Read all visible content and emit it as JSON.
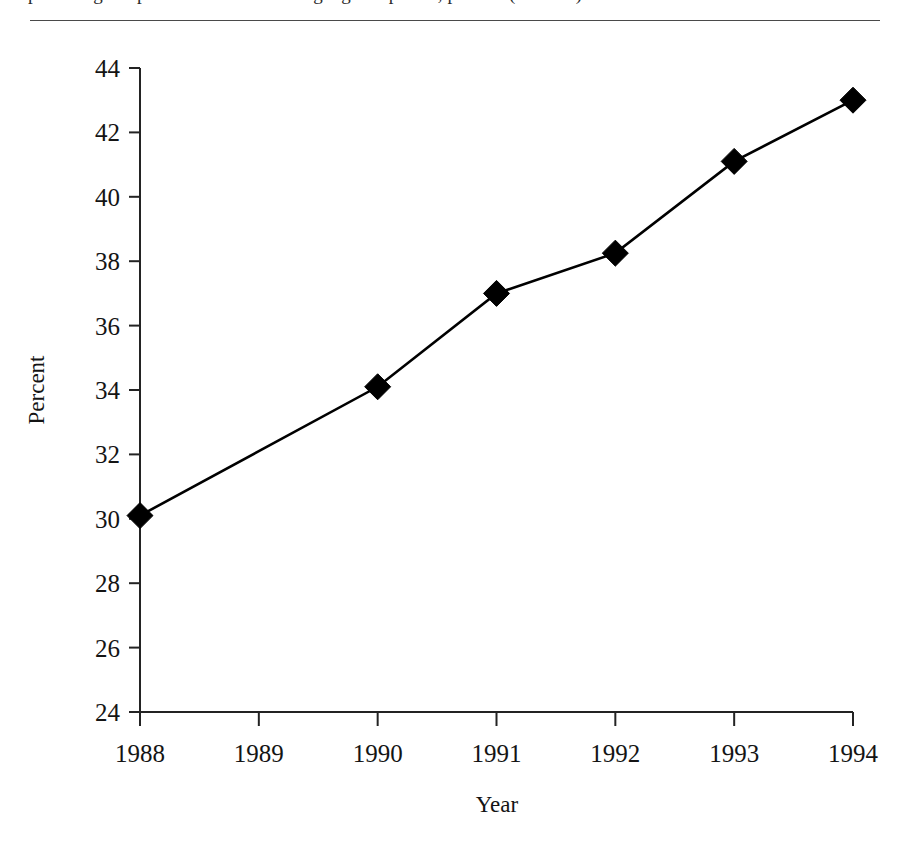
{
  "caption": {
    "text": "percentage of persons screened during a given period, percent (or more)",
    "note": "top caption line is cropped; only glyph bottoms are visible above the horizontal rule"
  },
  "figure": {
    "axis_titles": {
      "x": "Year",
      "y": "Percent"
    }
  },
  "chart_data": {
    "type": "line",
    "title": "",
    "subtitle": "",
    "xlabel": "Year",
    "ylabel": "Percent",
    "x": [
      1988,
      1989,
      1990,
      1991,
      1992,
      1993,
      1994
    ],
    "xticklabels": [
      "1988",
      "1989",
      "1990",
      "1991",
      "1992",
      "1993",
      "1994"
    ],
    "xlim": [
      1988,
      1994
    ],
    "ylim": [
      24,
      44
    ],
    "yticks": [
      24,
      26,
      28,
      30,
      32,
      34,
      36,
      38,
      40,
      42,
      44
    ],
    "yticklabels": [
      "24",
      "26",
      "28",
      "30",
      "32",
      "34",
      "36",
      "38",
      "40",
      "42",
      "44"
    ],
    "grid": false,
    "legend": false,
    "legend_position": "none",
    "marker": "diamond",
    "marker_color": "#000000",
    "line_color": "#000000",
    "series": [
      {
        "name": "Percent",
        "points": [
          {
            "x": 1988,
            "y": 30.1,
            "marker": true
          },
          {
            "x": 1989,
            "y": 32.1,
            "marker": false
          },
          {
            "x": 1990,
            "y": 34.1,
            "marker": true
          },
          {
            "x": 1991,
            "y": 37.0,
            "marker": true
          },
          {
            "x": 1992,
            "y": 38.25,
            "marker": true
          },
          {
            "x": 1993,
            "y": 41.1,
            "marker": true
          },
          {
            "x": 1994,
            "y": 43.0,
            "marker": true
          }
        ]
      }
    ]
  }
}
